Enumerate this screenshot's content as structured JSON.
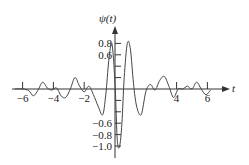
{
  "chart_data": {
    "type": "line",
    "title": "",
    "xlabel": "t",
    "ylabel": "ψ(t)",
    "xlim": [
      -7.5,
      8.5
    ],
    "ylim": [
      -1.1,
      1.0
    ],
    "grid": false,
    "legend": null,
    "x_ticks": [
      -6,
      -4,
      -2,
      4,
      6
    ],
    "x_tick_labels": [
      "−6",
      "−4",
      "−2",
      "4",
      "6"
    ],
    "y_ticks_pos": [
      0.8,
      0.6
    ],
    "y_ticks_neg": [
      -0.6,
      -0.8,
      -1.0
    ],
    "y_tick_labels_pos": [
      "0.8",
      "0.6"
    ],
    "y_tick_labels_neg": [
      "−0.6",
      "−0.8",
      "−1.0"
    ],
    "series": [
      {
        "name": "ψ(t)",
        "x": [
          -6.5,
          -6.0,
          -5.6,
          -5.3,
          -5.0,
          -4.7,
          -4.4,
          -4.1,
          -3.8,
          -3.5,
          -3.2,
          -2.9,
          -2.6,
          -2.3,
          -2.0,
          -1.7,
          -1.4,
          -1.1,
          -0.8,
          -0.6,
          -0.4,
          -0.2,
          0.0,
          0.15,
          0.3,
          0.45,
          0.6,
          0.8,
          1.0,
          1.2,
          1.4,
          1.7,
          2.0,
          2.3,
          2.6,
          2.9,
          3.2,
          3.5,
          3.8,
          4.1,
          4.4,
          4.7,
          5.0,
          5.3,
          5.6,
          5.9,
          6.2
        ],
        "y": [
          0.0,
          0.0,
          -0.03,
          -0.12,
          -0.02,
          0.12,
          0.02,
          -0.02,
          0.02,
          -0.12,
          -0.15,
          0.0,
          0.2,
          0.05,
          -0.05,
          0.05,
          -0.1,
          -0.3,
          -0.45,
          -0.1,
          0.5,
          0.8,
          0.1,
          -0.9,
          -1.0,
          -0.6,
          0.2,
          0.8,
          0.7,
          0.1,
          -0.3,
          -0.45,
          -0.05,
          0.08,
          -0.02,
          0.15,
          0.22,
          0.05,
          -0.15,
          0.0,
          0.0,
          0.05,
          0.0,
          0.12,
          0.0,
          -0.1,
          -0.02
        ]
      }
    ]
  },
  "axes": {
    "y_label_main": "ψ",
    "y_label_arg": "(t)",
    "x_label": "t"
  }
}
